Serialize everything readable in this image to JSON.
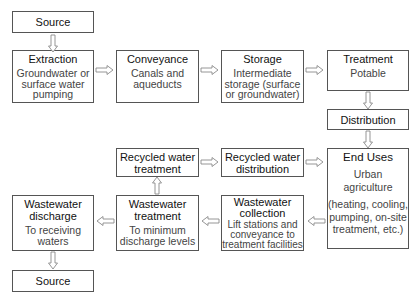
{
  "diagram": {
    "nodes": {
      "source_top": {
        "title": "Source"
      },
      "extraction": {
        "title": "Extraction",
        "desc": "Groundwater or\nsurface water\npumping"
      },
      "conveyance": {
        "title": "Conveyance",
        "desc": "Canals and\naqueducts"
      },
      "storage": {
        "title": "Storage",
        "desc": "Intermediate\nstorage (surface\nor groundwater)"
      },
      "treatment": {
        "title": "Treatment",
        "desc": "Potable"
      },
      "distribution": {
        "title": "Distribution"
      },
      "end_uses": {
        "title": "End Uses",
        "desc": "Urban\nagriculture",
        "desc2": "(heating, cooling,\npumping, on-site\ntreatment, etc.)"
      },
      "recycled_distribution": {
        "title": "Recycled water\ndistribution"
      },
      "recycled_treatment": {
        "title": "Recycled water\ntreatment"
      },
      "wastewater_collection": {
        "title": "Wastewater\ncollection",
        "desc": "Lift stations and\nconveyance to\ntreatment facilities"
      },
      "wastewater_treatment": {
        "title": "Wastewater\ntreatment",
        "desc": "To minimum\ndischarge levels"
      },
      "wastewater_discharge": {
        "title": "Wastewater\ndischarge",
        "desc": "To receiving\nwaters"
      },
      "source_bottom": {
        "title": "Source"
      }
    },
    "edges": [
      [
        "source_top",
        "extraction"
      ],
      [
        "extraction",
        "conveyance"
      ],
      [
        "conveyance",
        "storage"
      ],
      [
        "storage",
        "treatment"
      ],
      [
        "treatment",
        "distribution"
      ],
      [
        "distribution",
        "end_uses"
      ],
      [
        "end_uses",
        "wastewater_collection"
      ],
      [
        "wastewater_collection",
        "wastewater_treatment"
      ],
      [
        "wastewater_treatment",
        "wastewater_discharge"
      ],
      [
        "wastewater_discharge",
        "source_bottom"
      ],
      [
        "wastewater_treatment",
        "recycled_treatment"
      ],
      [
        "recycled_treatment",
        "recycled_distribution"
      ],
      [
        "recycled_distribution",
        "end_uses"
      ]
    ],
    "colors": {
      "border": "#555555",
      "arrow": "#8a8a8a",
      "title": "#111111",
      "desc": "#444444"
    }
  }
}
